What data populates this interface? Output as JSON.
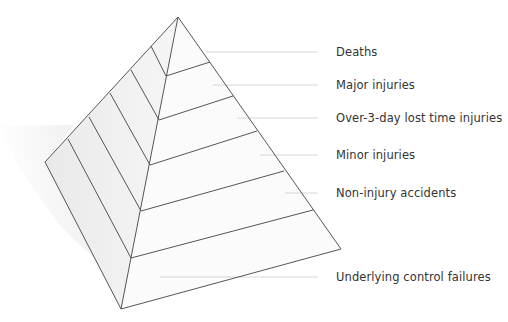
{
  "diagram": {
    "type": "pyramid",
    "title": "",
    "levels": [
      {
        "label": "Deaths",
        "label_y": 45,
        "leader": {
          "x1": 206,
          "x2": 318,
          "y": 52
        }
      },
      {
        "label": "Major injuries",
        "label_y": 78,
        "leader": {
          "x1": 213,
          "x2": 318,
          "y": 85
        }
      },
      {
        "label": "Over-3-day lost time injuries",
        "label_y": 111,
        "leader": {
          "x1": 237,
          "x2": 318,
          "y": 118
        }
      },
      {
        "label": "Minor injuries",
        "label_y": 148,
        "leader": {
          "x1": 260,
          "x2": 318,
          "y": 155
        }
      },
      {
        "label": "Non-injury accidents",
        "label_y": 186,
        "leader": {
          "x1": 285,
          "x2": 318,
          "y": 193
        }
      },
      {
        "label": "Underlying control failures",
        "label_y": 270,
        "leader": {
          "x1": 160,
          "x2": 318,
          "y": 277
        }
      }
    ],
    "colors": {
      "edge": "#555555",
      "leader": "#d4d4d4",
      "left_face": "#efefef",
      "right_face": "#fbfbfb",
      "shadow": "#f2f2f2",
      "text": "#333333"
    }
  }
}
